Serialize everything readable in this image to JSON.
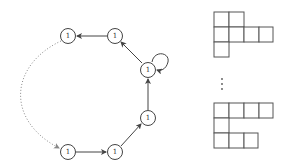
{
  "graph": {
    "nodes": [
      {
        "id": "n1",
        "label": "1",
        "x": 68,
        "y": 36
      },
      {
        "id": "n2",
        "label": "1",
        "x": 115,
        "y": 36
      },
      {
        "id": "n3",
        "label": "1",
        "x": 148,
        "y": 70
      },
      {
        "id": "n4",
        "label": "1",
        "x": 148,
        "y": 118
      },
      {
        "id": "n5",
        "label": "1",
        "x": 115,
        "y": 152
      },
      {
        "id": "n6",
        "label": "1",
        "x": 68,
        "y": 152
      }
    ],
    "edges": [
      {
        "from": "n2",
        "to": "n1",
        "style": "solid"
      },
      {
        "from": "n3",
        "to": "n2",
        "style": "solid"
      },
      {
        "from": "n3",
        "to": "n3",
        "style": "loop"
      },
      {
        "from": "n4",
        "to": "n3",
        "style": "solid"
      },
      {
        "from": "n5",
        "to": "n4",
        "style": "solid"
      },
      {
        "from": "n6",
        "to": "n5",
        "style": "solid"
      },
      {
        "from": "n1",
        "to": "n6",
        "style": "dotted"
      }
    ]
  },
  "young_diagrams": {
    "top_rows": [
      2,
      4,
      1
    ],
    "bottom_rows": [
      4,
      1,
      3
    ],
    "ellipsis": "vertical-dots"
  }
}
